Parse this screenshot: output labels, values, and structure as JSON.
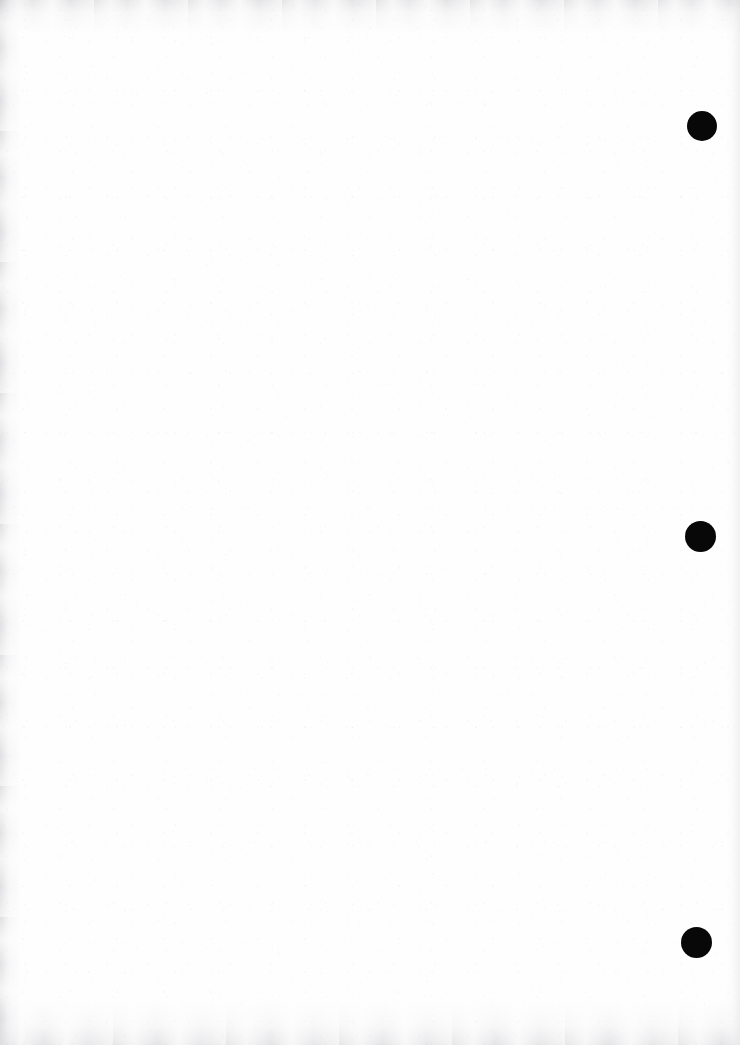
{
  "page": {
    "width": 740,
    "height": 1045,
    "kind": "scanned-blank-page",
    "background_color": "#fefefe",
    "caption": "",
    "body_text": ""
  },
  "marks": {
    "ink_color": "#080808",
    "dots": [
      {
        "id": "punch-dot-1",
        "cx": 702,
        "cy": 126,
        "d": 30
      },
      {
        "id": "punch-dot-2",
        "cx": 700,
        "cy": 536,
        "d": 31
      },
      {
        "id": "punch-dot-3",
        "cx": 696,
        "cy": 942,
        "d": 31
      }
    ]
  },
  "scan_edges": {
    "shadow_color": "#a8a8b0",
    "top_label": "",
    "left_label": "",
    "bottom_label": "",
    "right_label": ""
  }
}
